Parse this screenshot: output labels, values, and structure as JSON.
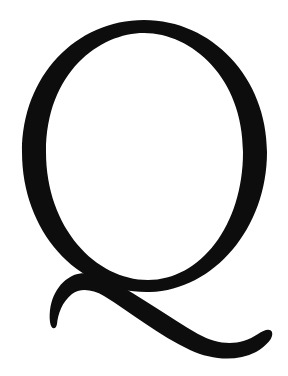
{
  "image": {
    "letter": "Q",
    "description": "Large black serif capital letter",
    "colors": {
      "glyph": "#0d0d0d",
      "background": "#ffffff"
    }
  }
}
